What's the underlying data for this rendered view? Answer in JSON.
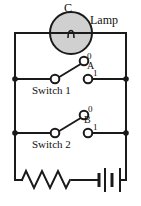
{
  "figure": {
    "type": "circuit-diagram",
    "title": "",
    "background_color": "#ffffff",
    "wire_color": "#1a1a1a",
    "lamp_fill_color": "#d0d0d0"
  },
  "labels": {
    "lamp_node": "C",
    "lamp_name": "Lamp",
    "switch1_name": "Switch 1",
    "switch1_terminal_top": "0",
    "switch1_pole": "A",
    "switch1_terminal_bottom": "1",
    "switch2_name": "Switch 2",
    "switch2_terminal_top": "0",
    "switch2_pole": "B",
    "switch2_terminal_bottom": "1"
  },
  "components": [
    {
      "id": "lamp",
      "name": "Lamp",
      "symbol": "circle-with-filament",
      "label": "C"
    },
    {
      "id": "switch1",
      "name": "Switch 1",
      "symbol": "spdt-switch",
      "position": "0"
    },
    {
      "id": "switch2",
      "name": "Switch 2",
      "symbol": "spdt-switch",
      "position": "0"
    },
    {
      "id": "resistor",
      "name": "Resistor",
      "symbol": "zigzag"
    },
    {
      "id": "battery",
      "name": "Battery",
      "symbol": "two-cell-battery"
    }
  ]
}
